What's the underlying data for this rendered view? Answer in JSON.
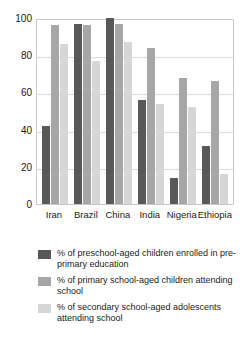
{
  "chart_data": {
    "type": "bar",
    "title": "",
    "xlabel": "",
    "ylabel": "",
    "ylim": [
      0,
      100
    ],
    "yticks": [
      0,
      20,
      40,
      60,
      80,
      100
    ],
    "grid": true,
    "legend_position": "below",
    "categories": [
      "Iran",
      "Brazil",
      "China",
      "India",
      "Nigeria",
      "Ethiopia"
    ],
    "series": [
      {
        "name": "% of preschool-aged children enrolled in pre-primary education",
        "color": "#585858",
        "values": [
          42,
          97,
          100,
          56,
          14,
          31
        ]
      },
      {
        "name": "% of primary school-aged children attending school",
        "color": "#a6a6a6",
        "values": [
          96,
          96,
          97,
          84,
          68,
          66
        ]
      },
      {
        "name": "% of secondary school-aged adolescents attending school",
        "color": "#d6d6d6",
        "values": [
          86,
          77,
          87,
          54,
          52,
          16
        ]
      }
    ]
  },
  "axis": {
    "y_tick_labels": [
      "0",
      "20",
      "40",
      "60",
      "80",
      "100"
    ],
    "x_tick_labels": [
      "Iran",
      "Brazil",
      "China",
      "India",
      "Nigeria",
      "Ethiopia"
    ]
  },
  "legend": {
    "items": [
      {
        "label": "% of preschool-aged children enrolled in pre-primary education",
        "color": "#585858"
      },
      {
        "label": "% of primary school-aged children attending school",
        "color": "#a6a6a6"
      },
      {
        "label": "% of secondary school-aged adolescents attending school",
        "color": "#d6d6d6"
      }
    ]
  }
}
